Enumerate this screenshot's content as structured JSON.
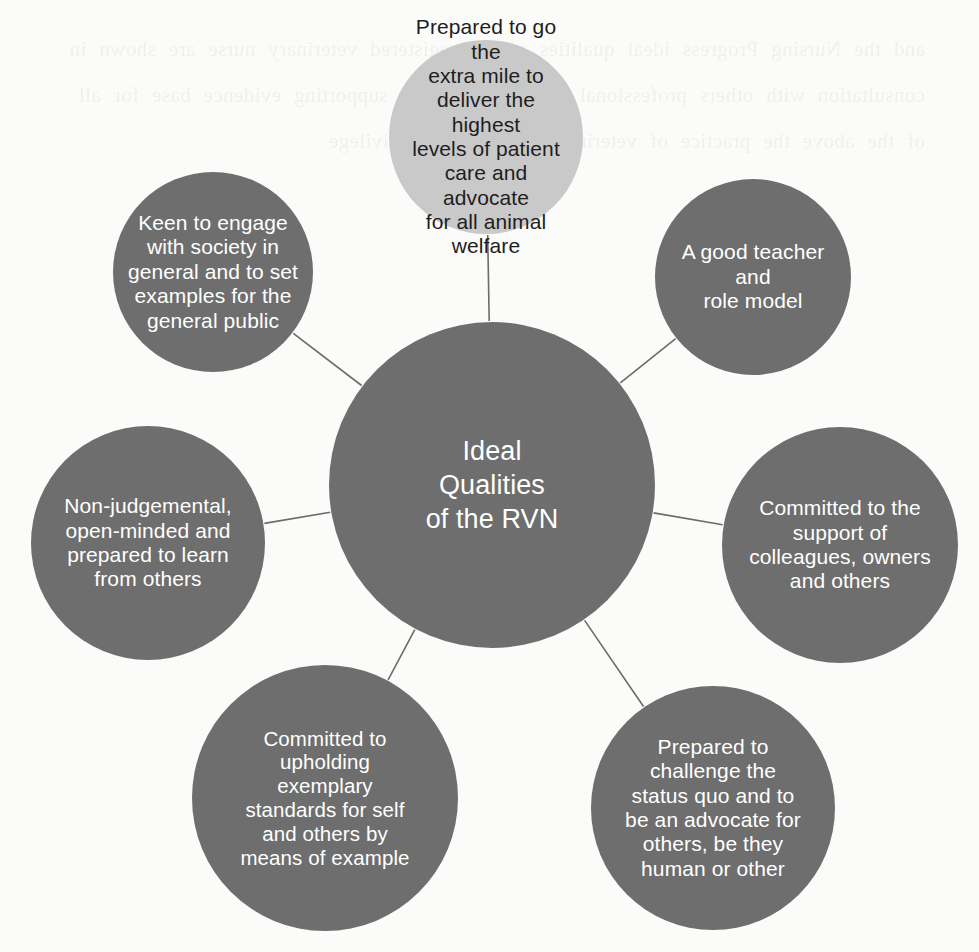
{
  "diagram": {
    "title": "Ideal Qualities of the RVN",
    "type": "radial-mind-map",
    "background_color": "#fbfbfa",
    "node_color": "#6e6e6e",
    "highlight_node_color": "#c9c9c9",
    "node_text_color": "#ffffff",
    "highlight_node_text_color": "#1e1e1e",
    "connector_color": "#6b6b6b",
    "bleed_text": "and the Nursing Progress ideal qualities of the registered veterinary nurse are shown in consultation with others professional standards and the supporting evidence base for all of the above the practice of veterinary nursing is a privilege"
  },
  "center": {
    "label": "Ideal\nQualities\nof the RVN",
    "cx": 492,
    "cy": 485,
    "r": 163
  },
  "nodes": [
    {
      "id": "extra-mile",
      "label": "Prepared to go the\nextra mile to\ndeliver the highest\nlevels of patient\ncare and advocate\nfor all animal\nwelfare",
      "cx": 486,
      "cy": 137,
      "r": 97,
      "highlight": true
    },
    {
      "id": "engage-society",
      "label": "Keen to engage\nwith society in\ngeneral and to set\nexamples for the\ngeneral public",
      "cx": 213,
      "cy": 272,
      "r": 100,
      "highlight": false
    },
    {
      "id": "teacher-role-model",
      "label": "A good teacher and\nrole model",
      "cx": 753,
      "cy": 277,
      "r": 98,
      "highlight": false
    },
    {
      "id": "non-judgemental",
      "label": "Non-judgemental,\nopen-minded and\nprepared to learn\nfrom others",
      "cx": 148,
      "cy": 543,
      "r": 117,
      "highlight": false
    },
    {
      "id": "support-colleagues",
      "label": "Committed to the\nsupport of\ncolleagues, owners\nand others",
      "cx": 840,
      "cy": 545,
      "r": 118,
      "highlight": false
    },
    {
      "id": "exemplary-standards",
      "label": "Committed to\nupholding\nexemplary\nstandards for self\nand others by\nmeans of example",
      "cx": 325,
      "cy": 798,
      "r": 133,
      "highlight": false
    },
    {
      "id": "challenge-status-quo",
      "label": "Prepared to\nchallenge the\nstatus quo and to\nbe an advocate for\nothers, be they\nhuman or other",
      "cx": 713,
      "cy": 808,
      "r": 122,
      "highlight": false
    }
  ]
}
